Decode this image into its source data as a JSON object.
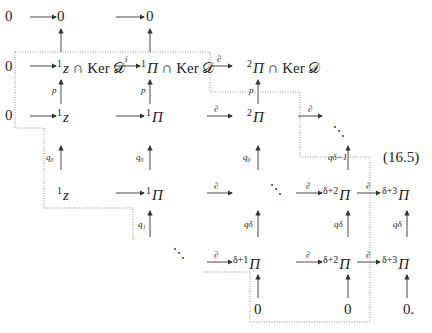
{
  "equation_number": "(16.5)",
  "symbols": {
    "zero": "0",
    "zero_period": "0.",
    "cap": "∩",
    "ker": "Ker",
    "D": "𝒟",
    "Pi": "Π",
    "z": "z",
    "diag_dots": "⋱"
  },
  "row0": {
    "n0": "0",
    "n1": "0",
    "n2": "0"
  },
  "row1": {
    "n0": "0",
    "n1": {
      "sup": "1",
      "base": "z",
      "rest": "∩ Ker 𝒟"
    },
    "n2": {
      "sup": "1",
      "base": "Π",
      "rest": "∩ Ker 𝒟"
    },
    "n3": {
      "sup": "2",
      "base": "Π",
      "rest": "∩ Ker 𝒟"
    },
    "arrow_i": "i",
    "arrow_d": "∂"
  },
  "row2": {
    "n0": "0",
    "n1": {
      "sup": "1",
      "base": "z"
    },
    "n2": {
      "sup": "1",
      "base": "Π"
    },
    "n3": {
      "sup": "2",
      "base": "Π"
    },
    "arrow_d1": "∂",
    "arrow_d2": "∂"
  },
  "row3": {
    "n1": {
      "sup": "1",
      "base": "z"
    },
    "n2": {
      "sup": "1",
      "base": "Π"
    },
    "n4": {
      "sup": "δ+2",
      "base": "Π"
    },
    "n5": {
      "sup": "δ+3",
      "base": "Π"
    },
    "arrow_d1": "∂",
    "arrow_d2": "∂",
    "arrow_d3": "∂"
  },
  "row4": {
    "n3": {
      "sup": "δ+1",
      "base": "Π"
    },
    "n4": {
      "sup": "δ+2",
      "base": "Π"
    },
    "n5": {
      "sup": "δ+3",
      "base": "Π"
    },
    "arrow_d1": "∂",
    "arrow_d2": "∂",
    "arrow_d3": "∂"
  },
  "row5": {
    "n3": "0",
    "n4": "0",
    "n5": "0."
  },
  "vertical_labels": {
    "p": "p",
    "q0": "q₀",
    "q1": "q₁",
    "qdm1": "q_{δ−1}",
    "qdm1_display": "qδ−1",
    "qd": "qδ"
  },
  "colors": {
    "ink": "#222222",
    "dotted_path": "#888888"
  }
}
